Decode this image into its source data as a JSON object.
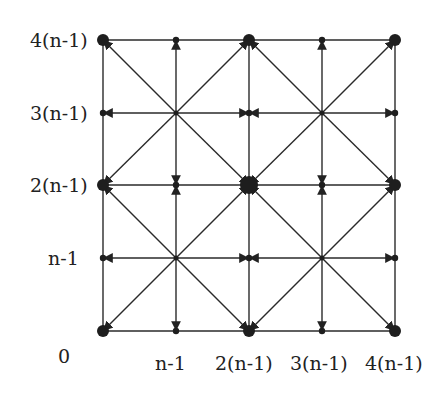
{
  "figure": {
    "y_labels": [
      {
        "text": "4(n-1)",
        "y": 40
      },
      {
        "text": "3(n-1)",
        "y": 113
      },
      {
        "text": "2(n-1)",
        "y": 185
      },
      {
        "text": "n-1",
        "y": 258
      }
    ],
    "origin_label": "0",
    "x_labels": [
      {
        "text": "n-1",
        "x": 176
      },
      {
        "text": "2(n-1)",
        "x": 249
      },
      {
        "text": "3(n-1)",
        "x": 322
      },
      {
        "text": "4(n-1)",
        "x": 395
      }
    ],
    "grid": {
      "xs": [
        103,
        176,
        249,
        322,
        395
      ],
      "ys": [
        40,
        113,
        185,
        258,
        331
      ]
    },
    "colors": {
      "line": "#2a2a2a",
      "node": "#1e1e1e",
      "background": "#ffffff"
    }
  }
}
